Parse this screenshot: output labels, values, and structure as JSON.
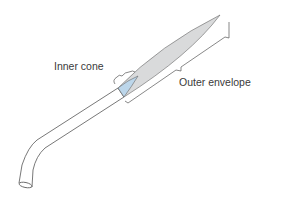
{
  "diagram": {
    "labels": {
      "inner_cone": "Inner cone",
      "outer_envelope": "Outer envelope"
    },
    "colors": {
      "outer_flame": "#d9dadb",
      "inner_cone": "#bcd6ea",
      "stroke": "#555555",
      "text": "#3a3a3a"
    }
  }
}
